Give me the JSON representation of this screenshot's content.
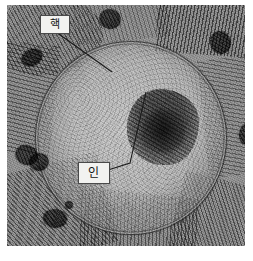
{
  "figure": {
    "kind": "transmission-electron-micrograph",
    "plate": {
      "x": 7,
      "y": 5,
      "width": 238,
      "height": 241
    }
  },
  "labels": [
    {
      "id": "nucleus",
      "text": "핵",
      "meaning": "nucleus",
      "box": {
        "x": 40,
        "y": 15,
        "width": 28,
        "height": 17
      },
      "leader": {
        "from_x": 56,
        "from_y": 32,
        "to_x": 112,
        "to_y": 72
      }
    },
    {
      "id": "nucleolus",
      "text": "인",
      "meaning": "nucleolus",
      "box": {
        "x": 78,
        "y": 162,
        "width": 30,
        "height": 20
      },
      "leader": {
        "from_x": 108,
        "from_y": 170,
        "bend_x": 130,
        "bend_y": 163,
        "to_x": 146,
        "to_y": 92
      }
    }
  ],
  "structures": {
    "nucleus": {
      "center_x": 123,
      "center_y": 132,
      "radius_x": 95,
      "radius_y": 96
    },
    "nucleolus": {
      "x": 127,
      "y": 89,
      "width": 72,
      "height": 76
    },
    "mitochondria_count": 8,
    "endoplasmic_reticulum_regions": 8
  },
  "colors": {
    "page_background": "#ffffff",
    "plate_midtone": "#9a9a9a",
    "nucleus_interior": "#bdbdbd",
    "nuclear_envelope": "#262626",
    "nucleolus_dark": "#3c3c3c",
    "label_box_fill": "#f2f2f0",
    "label_box_border": "#4a4a4a",
    "label_text": "#141414",
    "leader_line": "#1e1e1e"
  }
}
